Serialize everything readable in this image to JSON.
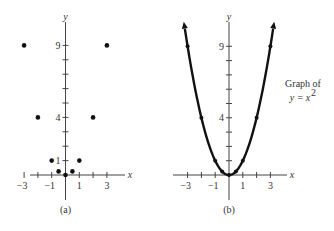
{
  "chart_data": [
    {
      "type": "scatter",
      "panel_label": "(a)",
      "xlabel": "x",
      "ylabel": "y",
      "x_tick_labels": [
        "-3",
        "-1",
        "1",
        "3"
      ],
      "y_tick_labels": [
        "1",
        "4",
        "9"
      ],
      "x_ticks": [
        -3,
        -2,
        -1,
        0,
        1,
        2,
        3
      ],
      "y_ticks": [
        1,
        2,
        3,
        4,
        5,
        6,
        7,
        8,
        9
      ],
      "xlim": [
        -3.9,
        3.9
      ],
      "ylim": [
        -1,
        10
      ],
      "points": [
        {
          "x": -3,
          "y": 9
        },
        {
          "x": -2,
          "y": 4
        },
        {
          "x": -1,
          "y": 1
        },
        {
          "x": -0.5,
          "y": 0.25
        },
        {
          "x": 0,
          "y": 0
        },
        {
          "x": 0.5,
          "y": 0.25
        },
        {
          "x": 1,
          "y": 1
        },
        {
          "x": 2,
          "y": 4
        },
        {
          "x": 3,
          "y": 9
        }
      ]
    },
    {
      "type": "line",
      "panel_label": "(b)",
      "xlabel": "x",
      "ylabel": "y",
      "x_tick_labels": [
        "-3",
        "-1",
        "1",
        "3"
      ],
      "y_tick_labels": [
        "4",
        "9"
      ],
      "x_ticks": [
        -3,
        -2,
        -1,
        0,
        1,
        2,
        3
      ],
      "y_ticks": [
        1,
        2,
        3,
        4,
        5,
        6,
        7,
        8,
        9
      ],
      "xlim": [
        -3.9,
        3.9
      ],
      "ylim": [
        -1,
        10
      ],
      "function": "y = x^2",
      "annotation": {
        "line1": "Graph of",
        "line2": "y = x",
        "superscript": "2"
      },
      "marked_points": [
        {
          "x": -3,
          "y": 9
        },
        {
          "x": -2,
          "y": 4
        },
        {
          "x": -1,
          "y": 1
        },
        {
          "x": -0.5,
          "y": 0.25
        },
        {
          "x": 0,
          "y": 0
        },
        {
          "x": 0.5,
          "y": 0.25
        },
        {
          "x": 1,
          "y": 1
        },
        {
          "x": 2,
          "y": 4
        },
        {
          "x": 3,
          "y": 9
        }
      ],
      "arrows_at_ends": true
    }
  ]
}
